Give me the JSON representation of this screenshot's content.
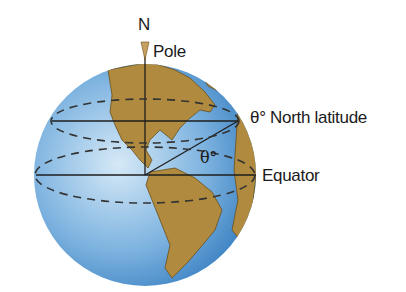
{
  "labels": {
    "north": "N",
    "pole": "Pole",
    "latitude": "θ° North latitude",
    "equator": "Equator",
    "angle": "θ°"
  },
  "colors": {
    "ocean_light": "#c8e0f4",
    "ocean_dark": "#3a86c8",
    "land": "#b08a3e",
    "land_edge": "#6b4f1c",
    "lines": "#1e1e1e"
  }
}
